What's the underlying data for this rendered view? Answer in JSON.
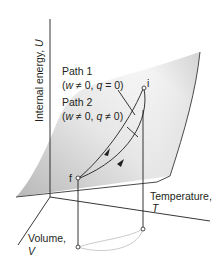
{
  "figure": {
    "axes": {
      "u_label": "Internal energy, ",
      "u_symbol": "U",
      "t_label": "Temperature,",
      "t_symbol": "T",
      "v_label": "Volume,",
      "v_symbol": "V"
    },
    "paths": [
      {
        "title": "Path 1",
        "condition_open": "(",
        "w": "w",
        "w_rel": " ≠ 0, ",
        "q": "q",
        "q_rel": " = 0)"
      },
      {
        "title": "Path 2",
        "condition_open": "(",
        "w": "w",
        "w_rel": " ≠ 0, ",
        "q": "q",
        "q_rel": " ≠ 0)"
      }
    ],
    "points": {
      "initial": "i",
      "final": "f"
    },
    "colors": {
      "surface_dark": "#bfbfbf",
      "surface_light": "#ffffff",
      "line": "#231f20",
      "projection": "#bdbdbd"
    }
  }
}
